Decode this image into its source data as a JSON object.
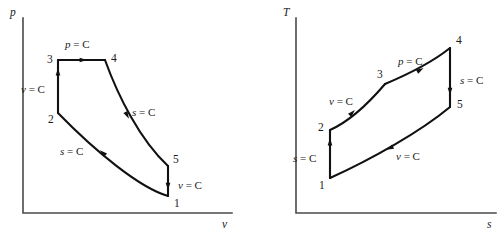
{
  "figure": {
    "stroke_color": "#111111",
    "axis_color": "#4a4a4a",
    "background": "#ffffff"
  },
  "chart_data": [
    {
      "type": "line",
      "title": "",
      "xlabel": "v",
      "ylabel": "p",
      "grid": false,
      "legend": null,
      "axis_ticks": [],
      "states": [
        {
          "name": "1",
          "x": 168,
          "y": 196,
          "label_dx": 6,
          "label_dy": 11
        },
        {
          "name": "2",
          "x": 58,
          "y": 113,
          "label_dx": -10,
          "label_dy": 10
        },
        {
          "name": "3",
          "x": 58,
          "y": 60,
          "label_dx": -11,
          "label_dy": 3
        },
        {
          "name": "4",
          "x": 105,
          "y": 60,
          "label_dx": 6,
          "label_dy": 2
        },
        {
          "name": "5",
          "x": 168,
          "y": 166,
          "label_dx": 5,
          "label_dy": -3
        }
      ],
      "processes": [
        {
          "from": "1",
          "to": "2",
          "label": "s = C",
          "var": "s",
          "path": "M 168 196 C 140 188, 96 152, 58 113",
          "arrow_x": 103,
          "arrow_y": 153,
          "arrow_angle": 222,
          "label_x": 60,
          "label_y": 155
        },
        {
          "from": "2",
          "to": "3",
          "label": "v = C",
          "var": "v",
          "path": "M 58 113 L 58 60",
          "arrow_x": 58,
          "arrow_y": 72,
          "arrow_angle": 270,
          "label_x": 21,
          "label_y": 93
        },
        {
          "from": "3",
          "to": "4",
          "label": "p = C",
          "var": "p",
          "path": "M 58 60 L 105 60",
          "arrow_x": 83,
          "arrow_y": 60,
          "arrow_angle": 0,
          "label_x": 65,
          "label_y": 48
        },
        {
          "from": "4",
          "to": "5",
          "label": "s = C",
          "var": "s",
          "path": "M 105 60 C 118 96, 140 140, 168 166",
          "arrow_x": 127,
          "arrow_y": 115,
          "arrow_angle": 62,
          "label_x": 132,
          "label_y": 116
        },
        {
          "from": "5",
          "to": "1",
          "label": "v = C",
          "var": "v",
          "path": "M 168 166 L 168 196",
          "arrow_x": 168,
          "arrow_y": 186,
          "arrow_angle": 90,
          "label_x": 178,
          "label_y": 189
        }
      ],
      "axes": {
        "origin_x": 23,
        "origin_y": 213,
        "top_y": 18,
        "right_x": 232,
        "ylabel_x": 10,
        "ylabel_y": 16,
        "xlabel_x": 222,
        "xlabel_y": 228
      }
    },
    {
      "type": "line",
      "title": "",
      "xlabel": "s",
      "ylabel": "T",
      "grid": false,
      "legend": null,
      "axis_ticks": [],
      "states": [
        {
          "name": "1",
          "x": 330,
          "y": 178,
          "label_dx": -11,
          "label_dy": 11
        },
        {
          "name": "2",
          "x": 330,
          "y": 130,
          "label_dx": -12,
          "label_dy": 1
        },
        {
          "name": "3",
          "x": 385,
          "y": 84,
          "label_dx": -8,
          "label_dy": -6
        },
        {
          "name": "4",
          "x": 450,
          "y": 48,
          "label_dx": 6,
          "label_dy": -4
        },
        {
          "name": "5",
          "x": 450,
          "y": 107,
          "label_dx": 7,
          "label_dy": 1
        }
      ],
      "processes": [
        {
          "from": "1",
          "to": "2",
          "label": "s = C",
          "var": "s",
          "path": "M 330 178 L 330 130",
          "arrow_x": 330,
          "arrow_y": 142,
          "arrow_angle": 270,
          "label_x": 293,
          "label_y": 162
        },
        {
          "from": "2",
          "to": "3",
          "label": "v = C",
          "var": "v",
          "path": "M 330 130 C 348 122, 368 104, 385 84",
          "arrow_x": 352,
          "arrow_y": 113,
          "arrow_angle": 315,
          "label_x": 329,
          "label_y": 105
        },
        {
          "from": "3",
          "to": "4",
          "label": "p = C",
          "var": "p",
          "path": "M 385 84 C 404 76, 430 64, 450 48",
          "arrow_x": 420,
          "arrow_y": 70,
          "arrow_angle": 330,
          "label_x": 398,
          "label_y": 65
        },
        {
          "from": "4",
          "to": "5",
          "label": "s = C",
          "var": "s",
          "path": "M 450 48 L 450 107",
          "arrow_x": 450,
          "arrow_y": 91,
          "arrow_angle": 90,
          "label_x": 460,
          "label_y": 84
        },
        {
          "from": "5",
          "to": "1",
          "label": "v = C",
          "var": "v",
          "path": "M 450 107 C 420 132, 370 160, 330 178",
          "arrow_x": 390,
          "arrow_y": 148,
          "arrow_angle": 155,
          "label_x": 396,
          "label_y": 160
        }
      ],
      "axes": {
        "origin_x": 296,
        "origin_y": 213,
        "top_y": 18,
        "right_x": 496,
        "ylabel_x": 283,
        "ylabel_y": 16,
        "xlabel_x": 487,
        "xlabel_y": 228
      }
    }
  ]
}
